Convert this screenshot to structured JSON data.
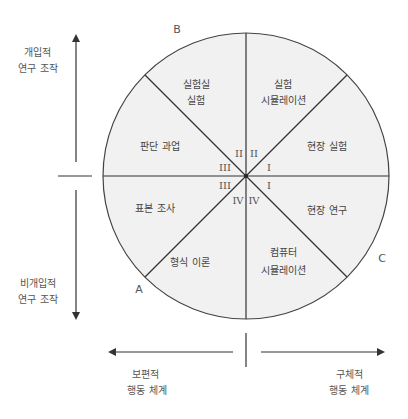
{
  "diagram": {
    "colors": {
      "circle_fill": "#f1f1f1",
      "line": "#333333",
      "text": "#444444"
    },
    "corners": {
      "a": "A",
      "b": "B",
      "c": "C"
    },
    "segments": [
      {
        "position": "upper-left-top",
        "line1": "실험실",
        "line2": "실험"
      },
      {
        "position": "upper-right-top",
        "line1": "실험",
        "line2": "시뮬레이션"
      },
      {
        "position": "upper-right-bottom",
        "line1": "현장 실험",
        "line2": ""
      },
      {
        "position": "lower-right-top",
        "line1": "현장 연구",
        "line2": ""
      },
      {
        "position": "lower-right-bottom",
        "line1": "컴퓨터",
        "line2": "시뮬레이션"
      },
      {
        "position": "lower-left-bottom",
        "line1": "형식 이론",
        "line2": ""
      },
      {
        "position": "lower-left-top",
        "line1": "표본 조사",
        "line2": ""
      },
      {
        "position": "upper-left-bottom",
        "line1": "판단 과업",
        "line2": ""
      }
    ],
    "quadrant_numerals": {
      "upper_left_top": "II",
      "upper_right_top": "II",
      "upper_right_bottom": "I",
      "lower_right_top": "I",
      "lower_right_bottom": "IV",
      "lower_left_bottom": "IV",
      "lower_left_top": "III",
      "upper_left_bottom": "III"
    },
    "vertical_axis": {
      "top_label_line1": "개입적",
      "top_label_line2": "연구 조작",
      "bottom_label_line1": "비개입적",
      "bottom_label_line2": "연구 조작"
    },
    "horizontal_axis": {
      "left_label_line1": "보편적",
      "left_label_line2": "행동 체계",
      "right_label_line1": "구체적",
      "right_label_line2": "행동 체계"
    }
  }
}
